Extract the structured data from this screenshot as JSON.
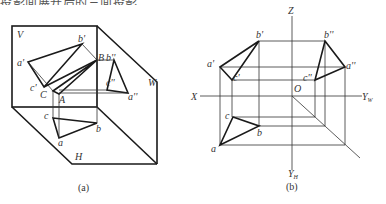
{
  "header": {
    "cut_text": "投影面展开后的三面投影…"
  },
  "figure_a": {
    "caption": "(a)",
    "planes": {
      "V": "V",
      "W": "W",
      "H": "H"
    },
    "points": {
      "a_prime": "a'",
      "b_prime": "b'",
      "c_prime": "c'",
      "B": "B",
      "b_dprime": "b''",
      "c_dprime": "c''",
      "a_dprime": "a''",
      "C": "C",
      "A": "A",
      "c": "c",
      "b": "b",
      "a": "a"
    }
  },
  "figure_b": {
    "caption": "(b)",
    "axes": {
      "Z": "Z",
      "X": "X",
      "Yw": "Y",
      "Yw_sub": "W",
      "Yh": "Y",
      "Yh_sub": "H",
      "O": "O"
    },
    "points": {
      "a_prime": "a'",
      "b_prime": "b'",
      "c_prime": "c'",
      "a_dprime": "a''",
      "b_dprime": "b''",
      "c_dprime": "c''",
      "a": "a",
      "b": "b",
      "c": "c"
    }
  }
}
